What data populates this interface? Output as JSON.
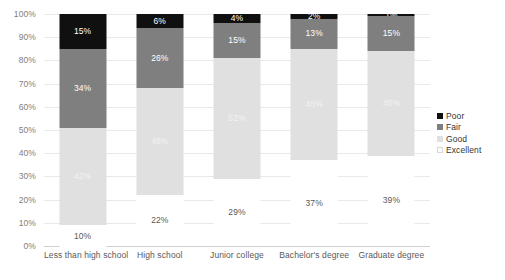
{
  "chart_data": {
    "type": "bar",
    "subtype": "100% stacked column",
    "title": "",
    "xlabel": "",
    "ylabel": "",
    "ylim": [
      0,
      100
    ],
    "grid": true,
    "legend_position": "right",
    "value_suffix": "%",
    "categories": [
      "Less than high school",
      "High school",
      "Junior college",
      "Bachelor's degree",
      "Graduate degree"
    ],
    "ytick_labels": [
      "0%",
      "10%",
      "20%",
      "30%",
      "40%",
      "50%",
      "60%",
      "70%",
      "80%",
      "90%",
      "100%"
    ],
    "ytick_values": [
      0,
      10,
      20,
      30,
      40,
      50,
      60,
      70,
      80,
      90,
      100
    ],
    "stack_order_bottom_to_top": [
      "Excellent",
      "Good",
      "Fair",
      "Poor"
    ],
    "series": [
      {
        "name": "Poor",
        "color": "#101010",
        "values": [
          15,
          6,
          4,
          2,
          1
        ],
        "labels": [
          "15%",
          "6%",
          "4%",
          "2%",
          "1%"
        ]
      },
      {
        "name": "Fair",
        "color": "#7f7f7f",
        "values": [
          34,
          26,
          15,
          13,
          15
        ],
        "labels": [
          "34%",
          "26%",
          "15%",
          "13%",
          "15%"
        ]
      },
      {
        "name": "Good",
        "color": "#e0e0e0",
        "values": [
          42,
          46,
          52,
          48,
          45
        ],
        "labels": [
          "42%",
          "46%",
          "52%",
          "48%",
          "45%"
        ]
      },
      {
        "name": "Excellent",
        "color": "#ffffff",
        "values": [
          10,
          22,
          29,
          37,
          39
        ],
        "labels": [
          "10%",
          "22%",
          "29%",
          "37%",
          "39%"
        ]
      }
    ]
  },
  "legend": {
    "items": [
      {
        "label": "Poor",
        "key": "poor"
      },
      {
        "label": "Fair",
        "key": "fair"
      },
      {
        "label": "Good",
        "key": "good"
      },
      {
        "label": "Excellent",
        "key": "excellent"
      }
    ]
  }
}
